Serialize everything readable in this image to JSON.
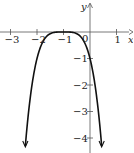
{
  "chart_data": {
    "type": "line",
    "title": "",
    "function": "y = -(x+1)^4",
    "xlabel": "x",
    "ylabel": "y",
    "xlim": [
      -3.3,
      1.5
    ],
    "ylim": [
      -4.6,
      1.2
    ],
    "x_ticks": [
      -3,
      -2,
      -1,
      0,
      1
    ],
    "x_tick_labels": [
      "−3",
      "−2",
      "−1",
      "0",
      "1"
    ],
    "y_ticks": [
      -1,
      -2,
      -3,
      -4
    ],
    "y_tick_labels": [
      "−1",
      "−2",
      "−3",
      "−4"
    ],
    "grid": false,
    "series": [
      {
        "name": "curve",
        "x": [
          -2.46,
          -2.4,
          -2.3,
          -2.2,
          -2.1,
          -2.0,
          -1.8,
          -1.6,
          -1.4,
          -1.2,
          -1.0,
          -0.8,
          -0.6,
          -0.4,
          -0.2,
          0.0,
          0.1,
          0.2,
          0.3,
          0.4,
          0.46
        ],
        "y": [
          -4.54,
          -3.84,
          -2.86,
          -2.07,
          -1.46,
          -1.0,
          -0.41,
          -0.13,
          -0.03,
          0.0,
          0.0,
          0.0,
          -0.03,
          -0.13,
          -0.41,
          -1.0,
          -1.46,
          -2.07,
          -2.86,
          -3.84,
          -4.54
        ],
        "arrows": "both-ends-down"
      }
    ]
  }
}
